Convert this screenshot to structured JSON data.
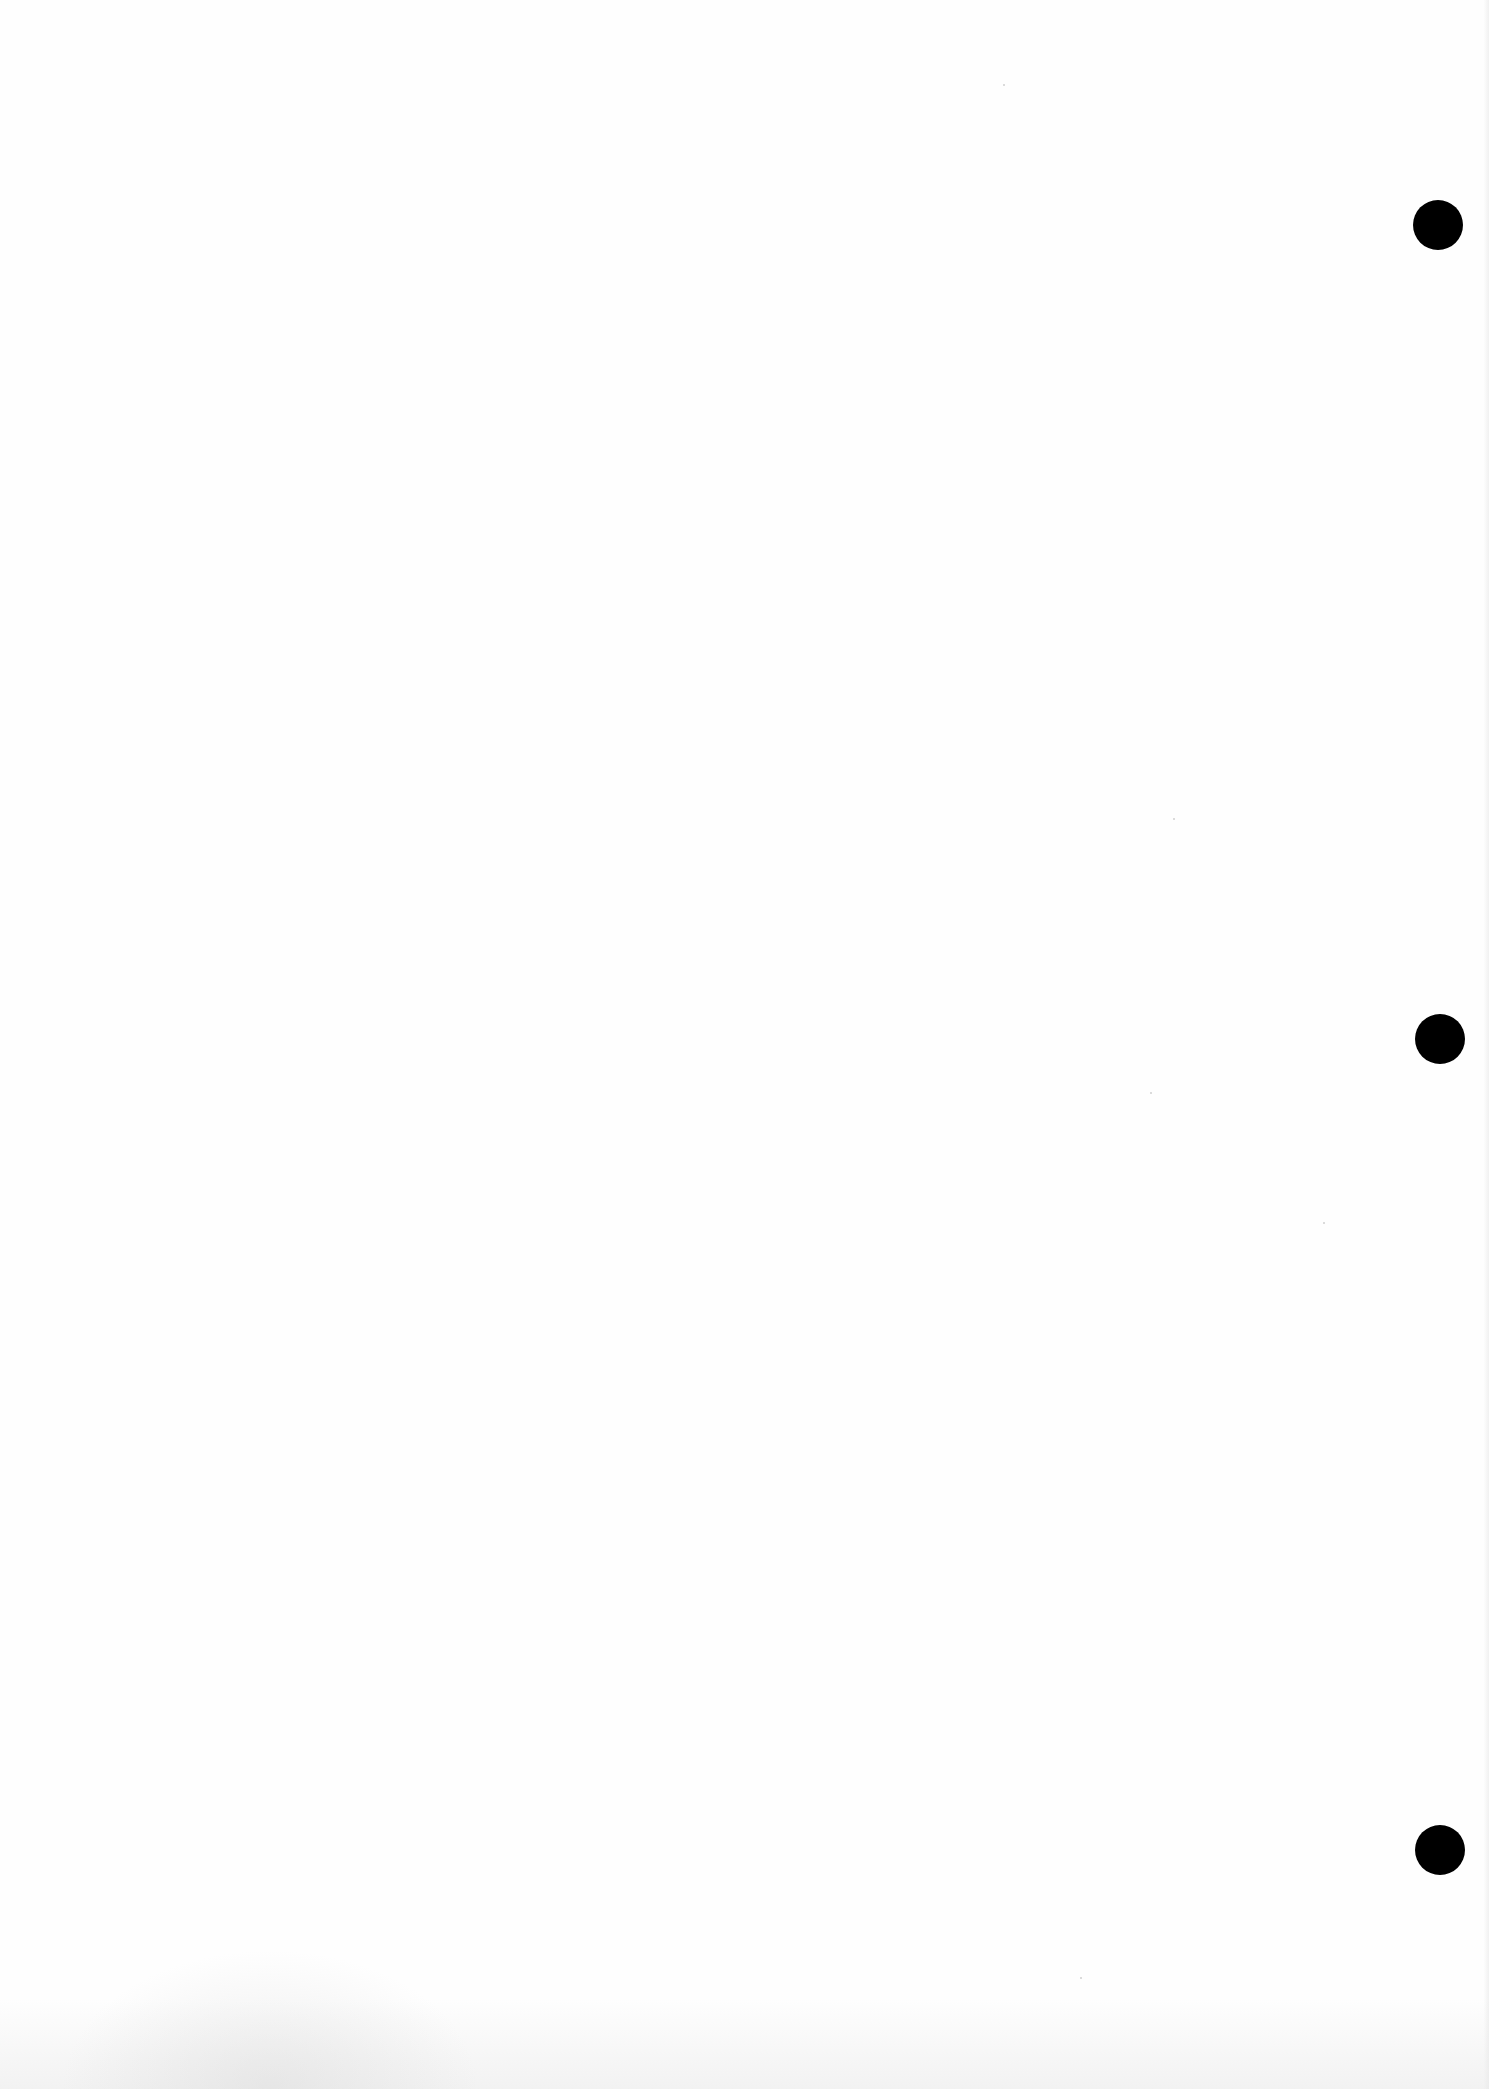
{
  "page": {
    "type": "blank-scanned-sheet",
    "width": 1489,
    "height": 2089,
    "background_color": "#fefefe",
    "text_content": ""
  },
  "punch_holes": [
    {
      "cx": 1438,
      "cy": 225,
      "diameter": 50,
      "color": "#000000"
    },
    {
      "cx": 1440,
      "cy": 1039,
      "diameter": 50,
      "color": "#000000"
    },
    {
      "cx": 1440,
      "cy": 1850,
      "diameter": 50,
      "color": "#000000"
    }
  ],
  "specks": [
    {
      "x": 1003,
      "y": 84
    },
    {
      "x": 1173,
      "y": 818
    },
    {
      "x": 1323,
      "y": 1222
    },
    {
      "x": 1150,
      "y": 1092
    },
    {
      "x": 1080,
      "y": 1977
    }
  ]
}
